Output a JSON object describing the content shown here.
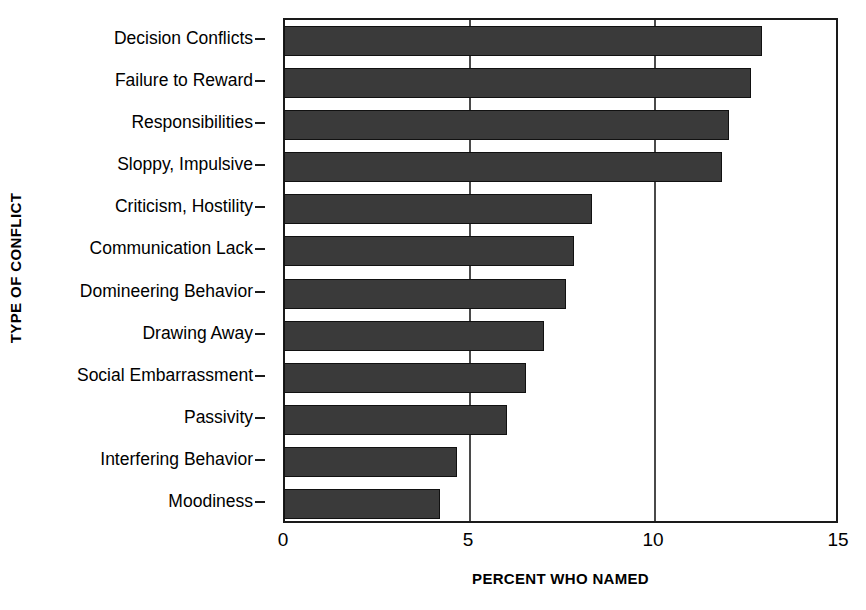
{
  "chart_data": {
    "type": "bar",
    "orientation": "horizontal",
    "title": "",
    "xlabel": "PERCENT WHO NAMED",
    "ylabel": "TYPE OF CONFLICT",
    "xlim": [
      0,
      15
    ],
    "xticks": [
      "0",
      "5",
      "10",
      "15"
    ],
    "xtick_values": [
      0,
      5,
      10,
      15
    ],
    "gridlines": [
      5,
      10
    ],
    "grid": true,
    "legend": null,
    "bar_color": "#3a3a3a",
    "bar_edge_color": "#111111",
    "axis_color": "#1a1a1a",
    "categories": [
      "Decision Conflicts",
      "Failure to Reward",
      "Responsibilities",
      "Sloppy, Impulsive",
      "Criticism, Hostility",
      "Communication Lack",
      "Domineering Behavior",
      "Drawing Away",
      "Social Embarrassment",
      "Passivity",
      "Interfering Behavior",
      "Moodiness"
    ],
    "values": [
      12.9,
      12.6,
      12.0,
      11.8,
      8.3,
      7.8,
      7.6,
      7.0,
      6.5,
      6.0,
      4.65,
      4.2
    ]
  }
}
